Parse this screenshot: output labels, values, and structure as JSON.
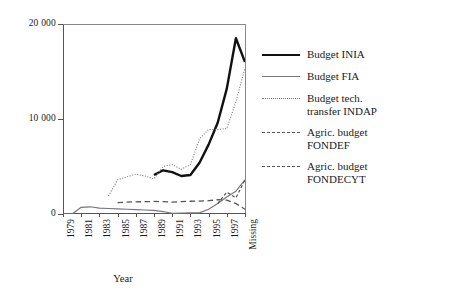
{
  "chart_data": {
    "type": "line",
    "title": "",
    "xlabel": "Year",
    "ylabel": "",
    "xlim": [
      1979,
      1999
    ],
    "ylim": [
      0,
      20000
    ],
    "grid": false,
    "legend_position": "right",
    "x_tick_labels": [
      "1979",
      "1981",
      "1983",
      "1985",
      "1987",
      "1989",
      "1991",
      "1993",
      "1995",
      "1997",
      "Missing"
    ],
    "x_tick_values": [
      1979,
      1981,
      1983,
      1985,
      1987,
      1989,
      1991,
      1993,
      1995,
      1997,
      1999
    ],
    "y_tick_labels": [
      "0",
      "10 000",
      "20 000"
    ],
    "y_tick_values": [
      0,
      10000,
      20000
    ],
    "x": [
      1979,
      1980,
      1981,
      1982,
      1983,
      1984,
      1985,
      1986,
      1987,
      1988,
      1989,
      1990,
      1991,
      1992,
      1993,
      1994,
      1995,
      1996,
      1997,
      1998,
      1999
    ],
    "series": [
      {
        "name": "Budget INIA",
        "style": "solid-thick",
        "color": "#111111",
        "values": [
          null,
          null,
          null,
          null,
          null,
          null,
          null,
          null,
          null,
          null,
          4100,
          4600,
          4400,
          4000,
          4100,
          5400,
          7300,
          9600,
          13200,
          18500,
          16000
        ]
      },
      {
        "name": "Budget FIA",
        "style": "solid-thin",
        "color": "#777777",
        "values": [
          0,
          0,
          700,
          760,
          620,
          580,
          540,
          500,
          470,
          420,
          380,
          260,
          60,
          90,
          110,
          120,
          500,
          1100,
          1800,
          2400,
          3600
        ]
      },
      {
        "name": "Budget tech. transfer INDAP",
        "style": "dotted",
        "color": "#777777",
        "values": [
          null,
          null,
          null,
          null,
          null,
          1900,
          3600,
          3900,
          4200,
          4000,
          3700,
          5000,
          5200,
          4700,
          5200,
          7900,
          8900,
          8900,
          9000,
          11800,
          15400
        ]
      },
      {
        "name": "Agric. budget FONDEF",
        "style": "dash-short",
        "color": "#555555",
        "values": [
          null,
          null,
          null,
          null,
          null,
          null,
          null,
          null,
          null,
          null,
          null,
          null,
          null,
          null,
          null,
          null,
          null,
          1100,
          2300,
          1700,
          3600
        ]
      },
      {
        "name": "Agric. budget FONDECYT",
        "style": "dash-long",
        "color": "#555555",
        "values": [
          null,
          null,
          null,
          null,
          null,
          null,
          1200,
          1250,
          1280,
          1300,
          1320,
          1300,
          1260,
          1300,
          1340,
          1360,
          1400,
          1500,
          1450,
          1100,
          500
        ]
      }
    ]
  },
  "axes": {
    "y_labels": [
      {
        "text": "20 000",
        "value": 20000
      },
      {
        "text": "10 000",
        "value": 10000
      },
      {
        "text": "0",
        "value": 0
      }
    ],
    "x_labels": [
      {
        "text": "1979"
      },
      {
        "text": "1981"
      },
      {
        "text": "1983"
      },
      {
        "text": "1985"
      },
      {
        "text": "1987"
      },
      {
        "text": "1989"
      },
      {
        "text": "1991"
      },
      {
        "text": "1993"
      },
      {
        "text": "1995"
      },
      {
        "text": "1997"
      },
      {
        "text": "Missing"
      }
    ],
    "x_title": "Year"
  },
  "legend": {
    "items": [
      {
        "line1": "Budget INIA",
        "line2": ""
      },
      {
        "line1": "Budget FIA",
        "line2": ""
      },
      {
        "line1": "Budget tech.",
        "line2": "transfer INDAP"
      },
      {
        "line1": "Agric. budget",
        "line2": "FONDEF"
      },
      {
        "line1": "Agric. budget",
        "line2": "FONDECYT"
      }
    ]
  }
}
